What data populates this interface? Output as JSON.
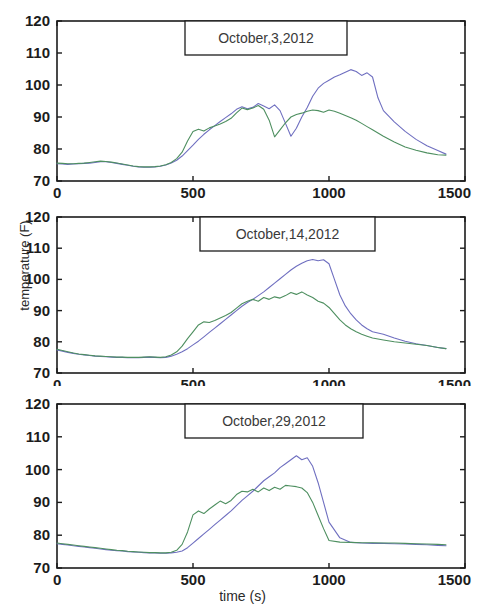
{
  "figure": {
    "xlabel": "time (s)",
    "ylabel": "temperature (F)",
    "axis_color": "#1c1c1c",
    "series_colors": {
      "blue": "#6f6fc0",
      "green": "#4e8f60"
    }
  },
  "chart_data": [
    {
      "type": "line",
      "title": "October,3,2012",
      "xlabel": "time (s)",
      "ylabel": "temperature (F)",
      "xlim": [
        0,
        1500
      ],
      "ylim": [
        70,
        120
      ],
      "xticks": [
        0,
        500,
        1000,
        1500
      ],
      "yticks": [
        70,
        80,
        90,
        100,
        110,
        120
      ],
      "grid": false,
      "legend": "none",
      "x": [
        0,
        20,
        40,
        60,
        80,
        100,
        120,
        140,
        160,
        180,
        200,
        220,
        240,
        260,
        280,
        300,
        320,
        340,
        360,
        380,
        400,
        420,
        440,
        460,
        480,
        500,
        520,
        540,
        560,
        580,
        600,
        620,
        640,
        660,
        680,
        700,
        720,
        740,
        760,
        780,
        800,
        820,
        840,
        860,
        880,
        900,
        920,
        940,
        960,
        980,
        1000,
        1020,
        1040,
        1060,
        1080,
        1100,
        1120,
        1140,
        1160,
        1180,
        1200,
        1240,
        1280,
        1320,
        1360,
        1400,
        1430
      ],
      "series": [
        {
          "name": "blue",
          "color": "#6f6fc0",
          "values": [
            75.4,
            75.3,
            75.2,
            75.3,
            75.4,
            75.5,
            75.6,
            75.8,
            76.0,
            76.0,
            75.8,
            75.5,
            75.2,
            74.9,
            74.6,
            74.4,
            74.3,
            74.3,
            74.4,
            74.6,
            75.0,
            75.6,
            76.5,
            77.8,
            79.5,
            81.2,
            83.0,
            84.6,
            86.0,
            87.3,
            88.6,
            89.8,
            91.0,
            92.4,
            93.2,
            92.6,
            93.0,
            94.2,
            93.4,
            92.6,
            93.8,
            92.0,
            88.0,
            84.0,
            86.5,
            90.0,
            93.0,
            96.5,
            99.0,
            100.5,
            101.5,
            102.5,
            103.2,
            104.0,
            104.8,
            104.2,
            103.0,
            103.8,
            102.5,
            96.0,
            92.0,
            88.5,
            85.5,
            83.0,
            81.0,
            79.5,
            78.4
          ]
        },
        {
          "name": "green",
          "color": "#4e8f60",
          "values": [
            75.6,
            75.5,
            75.4,
            75.4,
            75.5,
            75.6,
            75.8,
            76.0,
            76.2,
            76.1,
            75.9,
            75.6,
            75.3,
            75.0,
            74.7,
            74.5,
            74.4,
            74.4,
            74.5,
            74.7,
            75.1,
            75.8,
            77.0,
            79.0,
            82.5,
            85.5,
            86.2,
            85.6,
            86.6,
            87.2,
            87.8,
            88.6,
            89.6,
            91.3,
            92.8,
            92.3,
            92.8,
            93.6,
            92.4,
            89.0,
            83.8,
            86.0,
            88.2,
            90.0,
            90.8,
            91.2,
            91.8,
            92.2,
            92.0,
            91.5,
            92.2,
            91.8,
            91.2,
            90.5,
            89.8,
            89.0,
            88.0,
            87.0,
            86.0,
            85.0,
            84.0,
            82.2,
            80.6,
            79.6,
            78.8,
            78.2,
            78.1
          ]
        }
      ]
    },
    {
      "type": "line",
      "title": "October,14,2012",
      "xlabel": "time (s)",
      "ylabel": "temperature (F)",
      "xlim": [
        0,
        1500
      ],
      "ylim": [
        70,
        120
      ],
      "xticks": [
        0,
        500,
        1000,
        1500
      ],
      "yticks": [
        70,
        80,
        90,
        100,
        110,
        120
      ],
      "grid": false,
      "legend": "none",
      "x": [
        0,
        20,
        40,
        60,
        80,
        100,
        120,
        140,
        160,
        180,
        200,
        220,
        240,
        260,
        280,
        300,
        320,
        340,
        360,
        380,
        400,
        420,
        440,
        460,
        480,
        500,
        520,
        540,
        560,
        580,
        600,
        620,
        640,
        660,
        680,
        700,
        720,
        740,
        760,
        780,
        800,
        820,
        840,
        860,
        880,
        900,
        920,
        940,
        960,
        980,
        1000,
        1020,
        1040,
        1060,
        1080,
        1100,
        1120,
        1140,
        1160,
        1200,
        1240,
        1280,
        1320,
        1360,
        1400,
        1430
      ],
      "series": [
        {
          "name": "blue",
          "color": "#6f6fc0",
          "values": [
            77.4,
            77.0,
            76.6,
            76.3,
            76.0,
            75.8,
            75.6,
            75.4,
            75.3,
            75.2,
            75.1,
            75.0,
            75.0,
            74.9,
            74.9,
            74.9,
            75.0,
            75.1,
            75.0,
            74.9,
            75.0,
            75.4,
            76.0,
            76.8,
            77.8,
            79.0,
            80.2,
            81.6,
            83.0,
            84.4,
            85.8,
            87.2,
            88.6,
            90.0,
            91.4,
            92.6,
            93.6,
            94.8,
            96.0,
            97.4,
            98.8,
            100.2,
            101.6,
            103.0,
            104.2,
            105.2,
            106.0,
            106.4,
            106.0,
            106.3,
            105.0,
            100.0,
            95.0,
            91.5,
            89.0,
            87.0,
            85.4,
            84.2,
            83.2,
            82.4,
            81.2,
            80.2,
            79.4,
            78.8,
            78.2,
            77.8,
            77.6
          ]
        },
        {
          "name": "green",
          "color": "#4e8f60",
          "values": [
            77.6,
            77.2,
            76.8,
            76.4,
            76.1,
            75.9,
            75.7,
            75.5,
            75.4,
            75.3,
            75.2,
            75.1,
            75.1,
            75.0,
            75.0,
            75.0,
            75.1,
            75.2,
            75.1,
            75.0,
            75.2,
            75.8,
            76.8,
            78.6,
            81.0,
            83.2,
            85.4,
            86.4,
            86.2,
            86.8,
            87.6,
            88.4,
            89.4,
            90.8,
            92.2,
            93.0,
            93.6,
            93.0,
            94.2,
            93.6,
            94.4,
            94.0,
            94.8,
            95.8,
            95.2,
            96.0,
            95.0,
            94.2,
            93.0,
            92.4,
            91.0,
            89.0,
            87.0,
            85.4,
            84.2,
            83.2,
            82.4,
            81.8,
            81.2,
            80.6,
            80.0,
            79.6,
            79.2,
            78.8,
            78.2,
            77.8,
            77.6
          ]
        }
      ]
    },
    {
      "type": "line",
      "title": "October,29,2012",
      "xlabel": "time (s)",
      "ylabel": "temperature (F)",
      "xlim": [
        0,
        1500
      ],
      "ylim": [
        70,
        120
      ],
      "xticks": [
        0,
        500,
        1000,
        1500
      ],
      "yticks": [
        70,
        80,
        90,
        100,
        110,
        120
      ],
      "grid": false,
      "legend": "none",
      "x": [
        0,
        20,
        40,
        60,
        80,
        100,
        120,
        140,
        160,
        180,
        200,
        220,
        240,
        260,
        280,
        300,
        320,
        340,
        360,
        380,
        400,
        420,
        440,
        460,
        480,
        500,
        520,
        540,
        560,
        580,
        600,
        620,
        640,
        660,
        680,
        700,
        720,
        740,
        760,
        780,
        800,
        820,
        840,
        860,
        880,
        900,
        920,
        940,
        960,
        980,
        1000,
        1040,
        1080,
        1120,
        1160,
        1200,
        1240,
        1280,
        1320,
        1360,
        1400,
        1430
      ],
      "series": [
        {
          "name": "blue",
          "color": "#6f6fc0",
          "values": [
            77.4,
            77.2,
            77.0,
            76.8,
            76.6,
            76.4,
            76.2,
            76.0,
            75.8,
            75.6,
            75.4,
            75.3,
            75.2,
            75.0,
            74.9,
            74.8,
            74.7,
            74.6,
            74.6,
            74.5,
            74.5,
            74.6,
            74.8,
            75.2,
            76.2,
            77.6,
            79.0,
            80.4,
            81.8,
            83.2,
            84.6,
            86.0,
            87.4,
            89.0,
            90.6,
            92.0,
            93.4,
            95.0,
            96.6,
            97.8,
            99.0,
            100.6,
            101.8,
            103.0,
            104.2,
            103.0,
            103.6,
            101.0,
            96.0,
            90.0,
            84.0,
            79.2,
            77.8,
            77.6,
            77.5,
            77.5,
            77.4,
            77.3,
            77.2,
            77.1,
            76.9,
            76.8
          ]
        },
        {
          "name": "green",
          "color": "#4e8f60",
          "values": [
            77.6,
            77.4,
            77.2,
            77.0,
            76.8,
            76.6,
            76.4,
            76.2,
            76.0,
            75.8,
            75.6,
            75.4,
            75.3,
            75.1,
            75.0,
            74.9,
            74.8,
            74.7,
            74.7,
            74.6,
            74.6,
            74.8,
            75.4,
            77.2,
            81.0,
            86.2,
            87.4,
            86.6,
            88.0,
            89.2,
            90.4,
            89.6,
            90.6,
            92.4,
            93.4,
            93.2,
            94.0,
            93.2,
            94.4,
            93.6,
            94.6,
            94.0,
            95.2,
            95.0,
            94.8,
            94.4,
            93.0,
            90.0,
            86.0,
            82.0,
            78.4,
            77.9,
            77.8,
            77.7,
            77.7,
            77.6,
            77.6,
            77.5,
            77.4,
            77.3,
            77.2,
            77.1
          ]
        }
      ]
    }
  ]
}
